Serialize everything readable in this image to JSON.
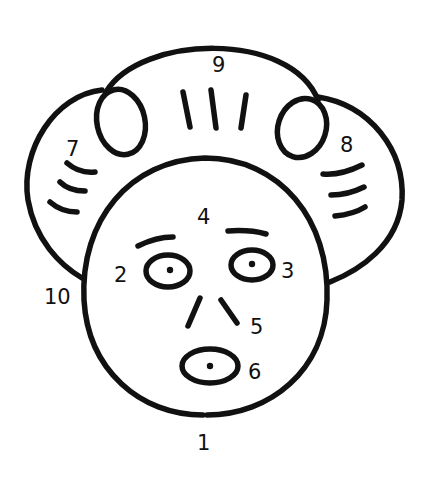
{
  "diagram": {
    "stroke_color": "#111111",
    "background": "#ffffff",
    "labels": [
      {
        "id": "1",
        "text": "1",
        "x": 197,
        "y": 450
      },
      {
        "id": "2",
        "text": "2",
        "x": 114,
        "y": 282
      },
      {
        "id": "3",
        "text": "3",
        "x": 281,
        "y": 278
      },
      {
        "id": "4",
        "text": "4",
        "x": 197,
        "y": 224
      },
      {
        "id": "5",
        "text": "5",
        "x": 250,
        "y": 334
      },
      {
        "id": "6",
        "text": "6",
        "x": 248,
        "y": 379
      },
      {
        "id": "7",
        "text": "7",
        "x": 66,
        "y": 156
      },
      {
        "id": "8",
        "text": "8",
        "x": 340,
        "y": 152
      },
      {
        "id": "9",
        "text": "9",
        "x": 212,
        "y": 72
      },
      {
        "id": "10",
        "text": "10",
        "x": 44,
        "y": 304
      }
    ],
    "parts": {
      "face": "face-outline",
      "left_eye": "eye-2",
      "right_eye": "eye-3",
      "eyebrows": "eyebrows-4",
      "nose": "nose-5",
      "mouth": "mouth-6",
      "left_hair": "hair-7",
      "right_hair": "hair-8",
      "top_hair": "hair-9",
      "left_side": "point-10"
    }
  }
}
